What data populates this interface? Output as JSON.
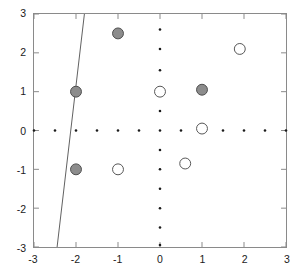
{
  "chart_data": {
    "type": "scatter",
    "title": "",
    "xlabel": "",
    "ylabel": "",
    "xlim": [
      -3,
      3
    ],
    "ylim": [
      -3,
      3
    ],
    "xticks": [
      -3,
      -2,
      -1,
      0,
      1,
      2,
      3
    ],
    "yticks": [
      -3,
      -2,
      -1,
      0,
      1,
      2,
      3
    ],
    "xticklabels": [
      "-3",
      "-2",
      "-1",
      "0",
      "1",
      "2",
      "3"
    ],
    "yticklabels": [
      "-3",
      "-2",
      "-1",
      "0",
      "1",
      "2",
      "3"
    ],
    "grid": false,
    "legend": null,
    "series": [
      {
        "name": "filled-gray-markers",
        "marker": "circle-filled",
        "fill_color": "#8c8c8c",
        "edge_color": "#4d4d4d",
        "marker_size": 11,
        "points": [
          {
            "x": -1,
            "y": 2.5
          },
          {
            "x": -2,
            "y": 1.0
          },
          {
            "x": 1,
            "y": 1.05
          },
          {
            "x": -2,
            "y": -1.0
          }
        ]
      },
      {
        "name": "open-white-markers",
        "marker": "circle-open",
        "fill_color": "#ffffff",
        "edge_color": "#555555",
        "marker_size": 11,
        "points": [
          {
            "x": 1.9,
            "y": 2.1
          },
          {
            "x": 0.0,
            "y": 1.0
          },
          {
            "x": 1.0,
            "y": 0.05
          },
          {
            "x": -1.0,
            "y": -1.0
          },
          {
            "x": 0.6,
            "y": -0.85
          }
        ]
      },
      {
        "name": "axis-dot-markers-horizontal",
        "marker": "dot",
        "fill_color": "#1a1a1a",
        "edge_color": "#1a1a1a",
        "marker_size": 2.6,
        "points": [
          {
            "x": -3.0,
            "y": 0
          },
          {
            "x": -2.5,
            "y": 0
          },
          {
            "x": -2.0,
            "y": 0
          },
          {
            "x": -1.5,
            "y": 0
          },
          {
            "x": -1.0,
            "y": 0
          },
          {
            "x": -0.5,
            "y": 0
          },
          {
            "x": 0.0,
            "y": 0
          },
          {
            "x": 0.5,
            "y": 0
          },
          {
            "x": 1.5,
            "y": 0
          },
          {
            "x": 2.0,
            "y": 0
          },
          {
            "x": 2.5,
            "y": 0
          },
          {
            "x": 3.0,
            "y": 0
          }
        ]
      },
      {
        "name": "axis-dot-markers-vertical",
        "marker": "dot",
        "fill_color": "#1a1a1a",
        "edge_color": "#1a1a1a",
        "marker_size": 2.6,
        "points": [
          {
            "x": 0,
            "y": 2.6
          },
          {
            "x": 0,
            "y": 2.1
          },
          {
            "x": 0,
            "y": 1.55
          },
          {
            "x": 0,
            "y": 0.5
          },
          {
            "x": 0,
            "y": -0.5
          },
          {
            "x": 0,
            "y": -1.0
          },
          {
            "x": 0,
            "y": -1.5
          },
          {
            "x": 0,
            "y": -2.0
          },
          {
            "x": 0,
            "y": -2.5
          },
          {
            "x": 0,
            "y": -2.95
          }
        ]
      }
    ],
    "annotations": [
      {
        "name": "decision-boundary-line",
        "type": "line",
        "color": "#4d4d4d",
        "width": 0.9,
        "from": {
          "x": -1.8,
          "y": 3.0
        },
        "to": {
          "x": -2.45,
          "y": -3.0
        }
      }
    ]
  }
}
